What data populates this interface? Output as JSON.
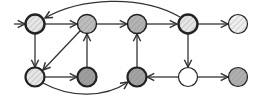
{
  "diagram": {
    "type": "directed-graph",
    "nodes": [
      {
        "id": "A",
        "x": 35,
        "y": 24,
        "fill": "#e6e6e6",
        "hatch": true,
        "stroke_width": 2.4
      },
      {
        "id": "B",
        "x": 87,
        "y": 24,
        "fill": "#bdbdbd",
        "hatch": true,
        "stroke_width": 1.4
      },
      {
        "id": "C",
        "x": 137,
        "y": 24,
        "fill": "#b3b3b3",
        "hatch": true,
        "stroke_width": 1.6
      },
      {
        "id": "D",
        "x": 188,
        "y": 24,
        "fill": "#e6e6e6",
        "hatch": true,
        "stroke_width": 2.4
      },
      {
        "id": "E",
        "x": 238,
        "y": 24,
        "fill": "#efefef",
        "hatch": true,
        "stroke_width": 1.2
      },
      {
        "id": "F",
        "x": 35,
        "y": 77,
        "fill": "#e6e6e6",
        "hatch": true,
        "stroke_width": 2.2
      },
      {
        "id": "G",
        "x": 87,
        "y": 77,
        "fill": "#9e9e9e",
        "hatch": true,
        "stroke_width": 2.2
      },
      {
        "id": "H",
        "x": 137,
        "y": 77,
        "fill": "#a3a3a3",
        "hatch": true,
        "stroke_width": 2.2
      },
      {
        "id": "I",
        "x": 188,
        "y": 77,
        "fill": "#ffffff",
        "hatch": false,
        "stroke_width": 1.2
      },
      {
        "id": "J",
        "x": 238,
        "y": 77,
        "fill": "#b0b0b0",
        "hatch": true,
        "stroke_width": 1.2
      }
    ],
    "edges": [
      {
        "from": "input",
        "to": "A"
      },
      {
        "from": "A",
        "to": "B"
      },
      {
        "from": "B",
        "to": "C"
      },
      {
        "from": "C",
        "to": "D"
      },
      {
        "from": "D",
        "to": "E"
      },
      {
        "from": "D",
        "to": "A",
        "curved": true
      },
      {
        "from": "A",
        "to": "F"
      },
      {
        "from": "B",
        "to": "F"
      },
      {
        "from": "F",
        "to": "G"
      },
      {
        "from": "G",
        "to": "B"
      },
      {
        "from": "H",
        "to": "C"
      },
      {
        "from": "F",
        "to": "H",
        "curved": true
      },
      {
        "from": "D",
        "to": "I"
      },
      {
        "from": "I",
        "to": "H"
      },
      {
        "from": "I",
        "to": "J"
      }
    ],
    "colors": {
      "stroke": "#222222",
      "edge": "#333333",
      "background": "#ffffff"
    }
  }
}
